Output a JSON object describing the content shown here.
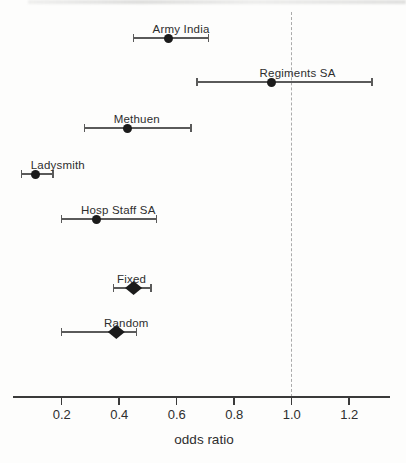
{
  "chart_data": {
    "type": "scatter",
    "subtype": "forest-plot",
    "title": "",
    "xlabel": "odds ratio",
    "xlim": [
      0.03,
      1.34
    ],
    "x_ticks": [
      0.2,
      0.4,
      0.6,
      0.8,
      1.0,
      1.2
    ],
    "x_tick_labels": [
      "0.2",
      "0.4",
      "0.6",
      "0.8",
      "1.0",
      "1.2"
    ],
    "reference_line_x": 1.0,
    "grid": false,
    "studies": [
      {
        "name": "Army India",
        "odds_ratio": 0.57,
        "ci_low": 0.45,
        "ci_high": 0.71,
        "marker": "circle"
      },
      {
        "name": "Regiments SA",
        "odds_ratio": 0.93,
        "ci_low": 0.67,
        "ci_high": 1.28,
        "marker": "circle"
      },
      {
        "name": "Methuen",
        "odds_ratio": 0.43,
        "ci_low": 0.28,
        "ci_high": 0.65,
        "marker": "circle"
      },
      {
        "name": "Ladysmith",
        "odds_ratio": 0.11,
        "ci_low": 0.06,
        "ci_high": 0.17,
        "marker": "circle"
      },
      {
        "name": "Hosp Staff SA",
        "odds_ratio": 0.32,
        "ci_low": 0.2,
        "ci_high": 0.53,
        "marker": "circle"
      },
      {
        "name": "Fixed",
        "odds_ratio": 0.45,
        "ci_low": 0.38,
        "ci_high": 0.51,
        "marker": "diamond"
      },
      {
        "name": "Random",
        "odds_ratio": 0.39,
        "ci_low": 0.2,
        "ci_high": 0.46,
        "marker": "diamond"
      }
    ],
    "colors": {
      "marker": "#1b1b1b",
      "ci_line": "#5a5a5a",
      "axis": "#3a3a3a",
      "reference_line": "#ababab",
      "text": "#2e2e2e",
      "background": "#fdfdfc"
    }
  }
}
